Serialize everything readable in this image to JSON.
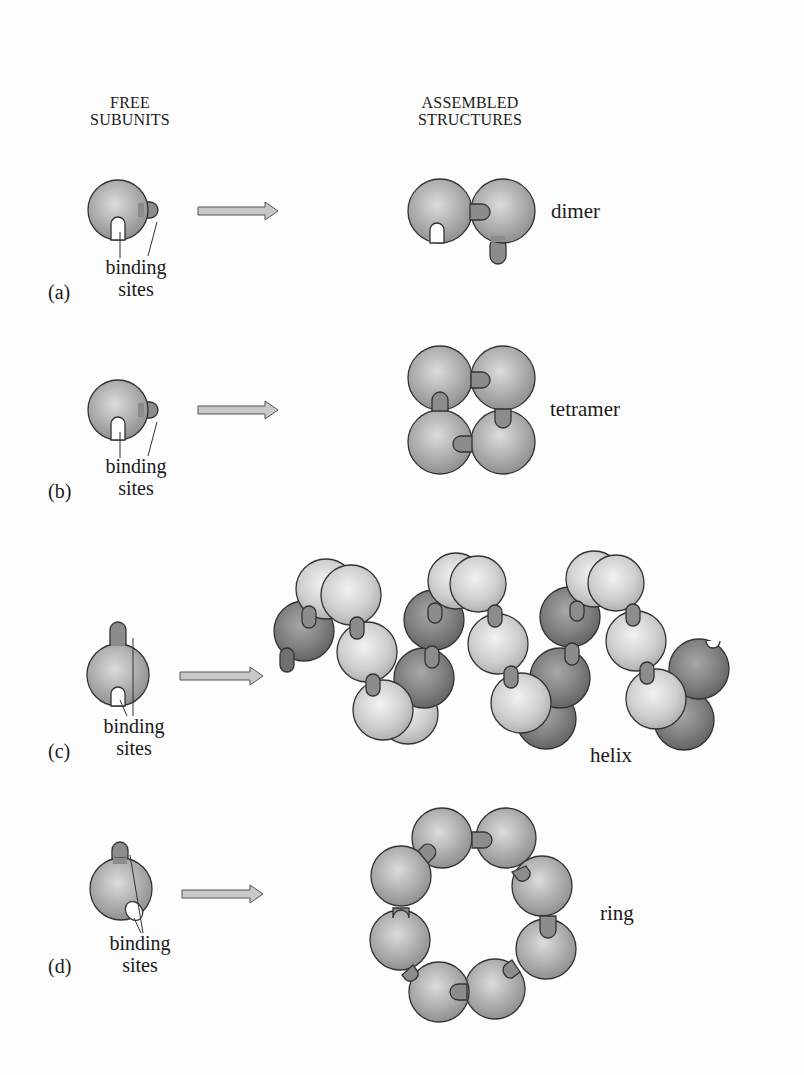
{
  "headers": {
    "free_subunits": [
      "FREE",
      "SUBUNITS"
    ],
    "assembled_structures": [
      "ASSEMBLED",
      "STRUCTURES"
    ]
  },
  "panels": [
    {
      "id": "a",
      "label": "(a)",
      "binding_label": [
        "binding",
        "sites"
      ],
      "structure": "dimer",
      "subunit_count": 2
    },
    {
      "id": "b",
      "label": "(b)",
      "binding_label": [
        "binding",
        "sites"
      ],
      "structure": "tetramer",
      "subunit_count": 4
    },
    {
      "id": "c",
      "label": "(c)",
      "binding_label": [
        "binding",
        "sites"
      ],
      "structure": "helix"
    },
    {
      "id": "d",
      "label": "(d)",
      "binding_label": [
        "binding",
        "sites"
      ],
      "structure": "ring",
      "subunit_count": 8
    }
  ],
  "colors": {
    "subunit_fill": "#a8a8a8",
    "subunit_light": "#d2d2d2",
    "subunit_dark": "#7a7a7a",
    "arrow_fill": "#c8c8c8",
    "outline": "#333333"
  }
}
